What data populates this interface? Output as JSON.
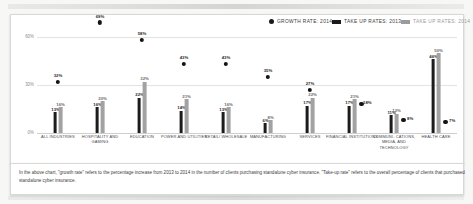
{
  "legend": {
    "items": [
      {
        "label": "GROWTH RATE: 2014",
        "marker": "dot",
        "color": "#141414"
      },
      {
        "label": "TAKE UP RATES: 2013",
        "marker": "swatch",
        "color": "#1c1c1c"
      },
      {
        "label": "TAKE UP RATES: 2014",
        "marker": "swatch",
        "color": "#a2a2a2"
      }
    ]
  },
  "yaxis": {
    "ticks": [
      "60%",
      "30%",
      "0%"
    ]
  },
  "footnote": {
    "text": "In the above chart, \"growth rate\" refers to the percentage increase from 2013 to 2014 in the number of clients purchasing standalone cyber insurance. \"Take-up rate\" refers to the overall percentage of clients that purchased standalone cyber insurance."
  },
  "chart_data": {
    "type": "bar",
    "title": "",
    "xlabel": "",
    "ylabel": "",
    "ylim": [
      0,
      60
    ],
    "grid": true,
    "legend_position": "top-right",
    "categories": [
      "ALL INDUSTRIES",
      "HOSPITALITY AND GAMING",
      "EDUCATION",
      "POWER AND UTILITIES",
      "RETAIL/ WHOLESALE",
      "MANUFACTURING",
      "SERVICES",
      "FINANCIAL INSTITUTIONS",
      "COMMUNI- CATIONS, MEDIA, AND TECHNOLOGY",
      "HEALTH CARE"
    ],
    "series": [
      {
        "name": "TAKE UP RATES: 2013",
        "type": "bar",
        "color": "#1c1c1c",
        "values": [
          13,
          16,
          22,
          14,
          13,
          6,
          17,
          17,
          11,
          46
        ],
        "labels": [
          "13%",
          "16%",
          "22%",
          "14%",
          "13%",
          "6%",
          "17%",
          "17%",
          "11%",
          "46%"
        ]
      },
      {
        "name": "TAKE UP RATES: 2014",
        "type": "bar",
        "color": "#a2a2a2",
        "values": [
          16,
          20,
          32,
          21,
          16,
          8,
          22,
          21,
          12,
          50
        ],
        "labels": [
          "16%",
          "20%",
          "32%",
          "21%",
          "16%",
          "8%",
          "22%",
          "21%",
          "12%",
          "50%"
        ]
      },
      {
        "name": "GROWTH RATE: 2014",
        "type": "scatter",
        "color": "#141414",
        "values": [
          32,
          69,
          58,
          43,
          43,
          35,
          27,
          18,
          8,
          7
        ],
        "labels": [
          "32%",
          "69%",
          "58%",
          "43%",
          "43%",
          "35%",
          "27%",
          "18%",
          "8%",
          "7%"
        ]
      }
    ]
  }
}
